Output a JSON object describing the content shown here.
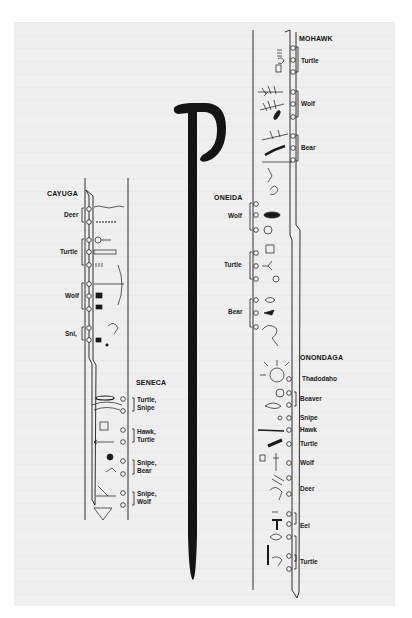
{
  "figure": {
    "nations": [
      {
        "name": "MOHAWK",
        "clans": [
          "Turtle",
          "Wolf",
          "Bear"
        ]
      },
      {
        "name": "ONEIDA",
        "clans": [
          "Wolf",
          "Turtle",
          "Bear"
        ]
      },
      {
        "name": "ONONDAGA",
        "clans": [
          "Thadodaho",
          "Beaver",
          "Snipe",
          "Hawk",
          "Turtle",
          "Wolf",
          "Deer",
          "Eel",
          "Turtle"
        ]
      },
      {
        "name": "CAYUGA",
        "clans": [
          "Deer",
          "Turtle",
          "Wolf",
          "Sni,"
        ]
      },
      {
        "name": "SENECA",
        "clans": [
          "Turtle,\nSnipe",
          "Hawk,\nTurtle",
          "Snipe,\nBear",
          "Snipe,\nWolf"
        ]
      }
    ]
  },
  "labels": {
    "mohawk": "MOHAWK",
    "mohawk_turtle": "Turtle",
    "mohawk_wolf": "Wolf",
    "mohawk_bear": "Bear",
    "oneida": "ONEIDA",
    "oneida_wolf": "Wolf",
    "oneida_turtle": "Turtle",
    "oneida_bear": "Bear",
    "onondaga": "ONONDAGA",
    "onondaga_thadodaho": "Thadodaho",
    "onondaga_beaver": "Beaver",
    "onondaga_snipe": "Snipe",
    "onondaga_hawk": "Hawk",
    "onondaga_turtle": "Turtle",
    "onondaga_wolf": "Wolf",
    "onondaga_deer": "Deer",
    "onondaga_eel": "Eel",
    "onondaga_turtle2": "Turtle",
    "cayuga": "CAYUGA",
    "cayuga_deer": "Deer",
    "cayuga_turtle": "Turtle",
    "cayuga_wolf": "Wolf",
    "cayuga_snipe": "Sni,",
    "seneca": "SENECA",
    "seneca_1a": "Turtle,",
    "seneca_1b": "Snipe",
    "seneca_2a": "Hawk,",
    "seneca_2b": "Turtle",
    "seneca_3a": "Snipe,",
    "seneca_3b": "Bear",
    "seneca_4a": "Snipe,",
    "seneca_4b": "Wolf"
  },
  "colors": {
    "ink": "#1a1a1a",
    "cane": "#141414",
    "paper": "#efefef"
  }
}
